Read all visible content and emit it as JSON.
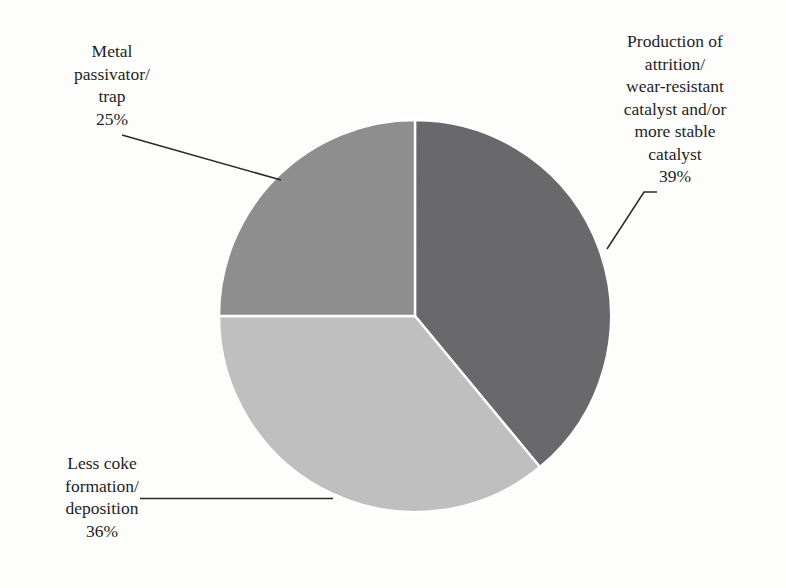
{
  "figure": {
    "background_color": "#fdfdfc",
    "text_color": "#1f1f1f",
    "leader_line_color": "#2a2a2a"
  },
  "bleed_through": {
    "line1": "",
    "line2": "",
    "line3": "",
    "line4": "",
    "line5": "",
    "line6": ""
  },
  "labels": {
    "attrition": {
      "line1": "Production of",
      "line2": "attrition/",
      "line3": "wear-resistant",
      "line4": "catalyst and/or",
      "line5": "more stable",
      "line6": "catalyst",
      "percent": "39%"
    },
    "passivator": {
      "line1": "Metal",
      "line2": "passivator/",
      "line3": "trap",
      "percent": "25%"
    },
    "coke": {
      "line1": "Less coke",
      "line2": "formation/",
      "line3": "deposition",
      "percent": "36%"
    }
  },
  "chart_data": {
    "type": "pie",
    "title": "",
    "subtitle": "",
    "xlabel": "",
    "ylabel": "",
    "grid": false,
    "legend_position": "none",
    "units": "percent",
    "total": 100,
    "start_angle_deg": 0,
    "direction": "clockwise",
    "center": {
      "x": 415,
      "y": 316
    },
    "radius": 196,
    "slice_separator_color": "#ffffff",
    "categories": [
      "Production of attrition/wear-resistant catalyst and/or more stable catalyst",
      "Less coke formation/deposition",
      "Metal passivator/trap"
    ],
    "values": [
      39,
      36,
      25
    ],
    "labels_display": [
      "39%",
      "36%",
      "25%"
    ],
    "colors": [
      "#69696b",
      "#bfbfbf",
      "#8e8e8e"
    ],
    "slices": [
      {
        "name": "Production of attrition/wear-resistant catalyst and/or more stable catalyst",
        "short_name": "attrition-resistant-catalyst",
        "value": 39,
        "display": "39%",
        "color": "#69696b",
        "start_angle_deg": 0,
        "end_angle_deg": 140.4
      },
      {
        "name": "Less coke formation/deposition",
        "short_name": "less-coke-formation",
        "value": 36,
        "display": "36%",
        "color": "#bfbfbf",
        "start_angle_deg": 140.4,
        "end_angle_deg": 270
      },
      {
        "name": "Metal passivator/trap",
        "short_name": "metal-passivator-trap",
        "value": 25,
        "display": "25%",
        "color": "#8e8e8e",
        "start_angle_deg": 270,
        "end_angle_deg": 360
      }
    ]
  }
}
